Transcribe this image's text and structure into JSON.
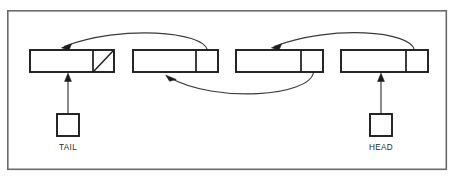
{
  "diagram": {
    "type": "linked-list-diagram",
    "canvas": {
      "width": 454,
      "height": 177,
      "background": "#ffffff"
    },
    "frame": {
      "name": "outer-frame",
      "x": 7,
      "y": 10,
      "width": 440,
      "height": 160,
      "stroke": "#6b6b6b",
      "fill": "#ffffff"
    },
    "colors": {
      "node_stroke": "#1c1c1c",
      "frame_stroke": "#6b6b6b",
      "arrow_stroke": "#3a3a3a",
      "text": "#2a2a2a",
      "background": "#ffffff"
    },
    "nodes": [
      {
        "id": "node-1",
        "label": "",
        "x": 30,
        "y": 50,
        "width": 84,
        "height": 22,
        "divider_offset": 63,
        "next_cell_null": true,
        "null_marker": "diagonal-slash",
        "role": "tail-node"
      },
      {
        "id": "node-2",
        "label": "",
        "x": 133,
        "y": 50,
        "width": 85,
        "height": 22,
        "divider_offset": 63,
        "next_cell_null": false,
        "null_marker": "",
        "role": "middle-node"
      },
      {
        "id": "node-3",
        "label": "",
        "x": 236,
        "y": 50,
        "width": 87,
        "height": 22,
        "divider_offset": 65,
        "next_cell_null": false,
        "null_marker": "",
        "role": "middle-node"
      },
      {
        "id": "node-4",
        "label": "",
        "x": 341,
        "y": 50,
        "width": 87,
        "height": 22,
        "divider_offset": 65,
        "next_cell_null": false,
        "null_marker": "",
        "role": "head-node"
      }
    ],
    "pointers": [
      {
        "id": "tail-pointer",
        "label": "TAIL",
        "box": {
          "x": 57,
          "y": 114,
          "width": 22,
          "height": 22
        },
        "label_x": 68,
        "label_y": 148,
        "connector": {
          "from_x": 68,
          "from_y": 114,
          "to_x": 68,
          "to_y": 74
        },
        "target_node": "node-1"
      },
      {
        "id": "head-pointer",
        "label": "HEAD",
        "box": {
          "x": 370,
          "y": 114,
          "width": 22,
          "height": 22
        },
        "label_x": 381,
        "label_y": 148,
        "connector": {
          "from_x": 381,
          "from_y": 114,
          "to_x": 381,
          "to_y": 74
        },
        "target_node": "node-4"
      }
    ],
    "links": [
      {
        "id": "link-node2-to-node1",
        "direction": "right-to-left",
        "side": "top",
        "from_node": "node-2",
        "to_node": "node-1",
        "path": "M 207 50 C 200 32 120 25 63 47",
        "arrow_at": {
          "x": 63,
          "y": 47,
          "angle": 155
        }
      },
      {
        "id": "link-node4-to-node3",
        "direction": "right-to-left",
        "side": "top",
        "from_node": "node-4",
        "to_node": "node-3",
        "path": "M 414 50 C 408 31 330 25 273 47",
        "arrow_at": {
          "x": 273,
          "y": 47,
          "angle": 155
        }
      },
      {
        "id": "link-node3-to-node2",
        "direction": "right-to-left",
        "side": "bottom",
        "from_node": "node-3",
        "to_node": "node-2",
        "path": "M 313 72 C 310 95 215 103 167 76",
        "arrow_at": {
          "x": 167,
          "y": 76,
          "angle": 208
        }
      }
    ]
  }
}
